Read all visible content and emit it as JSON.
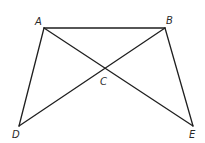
{
  "diagram": {
    "type": "geometry",
    "points": {
      "A": {
        "label": "A",
        "x": 44,
        "y": 28,
        "lx": 35,
        "ly": 25
      },
      "B": {
        "label": "B",
        "x": 165,
        "y": 28,
        "lx": 166,
        "ly": 24
      },
      "C": {
        "label": "C",
        "x": 105,
        "y": 69,
        "lx": 100,
        "ly": 85
      },
      "D": {
        "label": "D",
        "x": 19,
        "y": 126,
        "lx": 12,
        "ly": 138
      },
      "E": {
        "label": "E",
        "x": 193,
        "y": 126,
        "lx": 189,
        "ly": 138
      }
    },
    "segments": [
      {
        "from": "A",
        "to": "B"
      },
      {
        "from": "A",
        "to": "D"
      },
      {
        "from": "A",
        "to": "E"
      },
      {
        "from": "B",
        "to": "D"
      },
      {
        "from": "B",
        "to": "E"
      }
    ],
    "intersection": {
      "point": "C",
      "of": [
        "AE",
        "BD"
      ]
    },
    "stroke_color": "#1f1f1f"
  }
}
